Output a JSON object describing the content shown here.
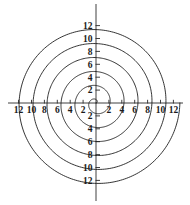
{
  "chart_data": {
    "type": "line",
    "title": "",
    "subtitle": "",
    "xlabel": "",
    "ylabel": "",
    "curve_name": "archimedean-spiral",
    "polar_equation": "r = a*theta",
    "a": 0.345,
    "theta_start": 0,
    "theta_end": 37.7,
    "turns": 6,
    "r_max": 13.0,
    "end_point_xy": [
      12.6,
      -3.2
    ],
    "grid": false,
    "legend": false,
    "xlim": [
      -13.5,
      13.5
    ],
    "ylim": [
      -13.5,
      13.5
    ],
    "x_ticks": [
      -12,
      -10,
      -8,
      -6,
      -4,
      -2,
      2,
      4,
      6,
      8,
      10,
      12
    ],
    "y_ticks": [
      -12,
      -10,
      -8,
      -6,
      -4,
      -2,
      2,
      4,
      6,
      8,
      10,
      12
    ],
    "x_tick_labels": [
      "12",
      "10",
      "8",
      "6",
      "4",
      "2",
      "2",
      "4",
      "6",
      "8",
      "10",
      "12"
    ],
    "y_tick_labels": [
      "12",
      "10",
      "8",
      "6",
      "4",
      "2",
      "2",
      "4",
      "6",
      "8",
      "10",
      "12"
    ],
    "series": [
      {
        "name": "spiral",
        "radii_at_axis_crossings_right": [
          0.5,
          2.7,
          4.8,
          7.0,
          9.2,
          11.3
        ],
        "radii_at_axis_crossings_up": [
          1.1,
          3.2,
          5.4,
          7.6,
          9.7,
          11.9
        ],
        "radii_at_axis_crossings_left": [
          1.6,
          3.8,
          6.0,
          8.1,
          10.3,
          12.4
        ],
        "radii_at_axis_crossings_down": [
          2.2,
          4.3,
          6.5,
          8.7,
          10.8,
          13.0
        ]
      }
    ]
  },
  "axes": {
    "origin_px": [
      96,
      103
    ],
    "units_per_pixel": 6.45,
    "x_axis_label": "",
    "y_axis_label": "",
    "x_ticks": [
      {
        "value": -12,
        "label": "12"
      },
      {
        "value": -10,
        "label": "10"
      },
      {
        "value": -8,
        "label": "8"
      },
      {
        "value": -6,
        "label": "6"
      },
      {
        "value": -4,
        "label": "4"
      },
      {
        "value": -2,
        "label": "2"
      },
      {
        "value": 2,
        "label": "2"
      },
      {
        "value": 4,
        "label": "4"
      },
      {
        "value": 6,
        "label": "6"
      },
      {
        "value": 8,
        "label": "8"
      },
      {
        "value": 10,
        "label": "10"
      },
      {
        "value": 12,
        "label": "12"
      }
    ],
    "y_ticks": [
      {
        "value": 12,
        "label": "12"
      },
      {
        "value": 10,
        "label": "10"
      },
      {
        "value": 8,
        "label": "8"
      },
      {
        "value": 6,
        "label": "6"
      },
      {
        "value": 4,
        "label": "4"
      },
      {
        "value": 2,
        "label": "2"
      },
      {
        "value": -2,
        "label": "2"
      },
      {
        "value": -4,
        "label": "4"
      },
      {
        "value": -6,
        "label": "6"
      },
      {
        "value": -8,
        "label": "8"
      },
      {
        "value": -10,
        "label": "10"
      },
      {
        "value": -12,
        "label": "12"
      }
    ]
  },
  "style": {
    "background": "#ffffff",
    "axis_color": "#2b2b2b",
    "curve_color": "#111111",
    "label_color": "#1a1a1a"
  }
}
